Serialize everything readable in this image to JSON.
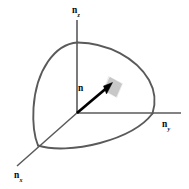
{
  "figure": {
    "type": "geometry-diagram",
    "canvas": {
      "width": 189,
      "height": 189,
      "background": "#ffffff"
    },
    "colors": {
      "arc_stroke": "#5a5a5a",
      "axis_stroke": "#5a5a5a",
      "vector_stroke": "#000000",
      "patch_fill": "#c9c9c9",
      "patch_stroke": "#b4b4b4",
      "text": "#0a0a0a",
      "background": "#ffffff"
    },
    "origin": {
      "x": 77,
      "y": 113
    },
    "axes": [
      {
        "name": "n-z-axis",
        "label_main": "n",
        "label_sub": "z",
        "direction": "up",
        "from": {
          "x": 77,
          "y": 113
        },
        "to": {
          "x": 77,
          "y": 20
        },
        "sphere_intersection": {
          "x": 77,
          "y": 42
        }
      },
      {
        "name": "n-y-axis",
        "label_main": "n",
        "label_sub": "y",
        "direction": "right",
        "from": {
          "x": 77,
          "y": 113
        },
        "to": {
          "x": 181,
          "y": 113
        },
        "sphere_intersection": {
          "x": 152,
          "y": 113
        }
      },
      {
        "name": "n-x-axis",
        "label_main": "n",
        "label_sub": "x",
        "direction": "down-left",
        "from": {
          "x": 77,
          "y": 113
        },
        "to": {
          "x": 17,
          "y": 166
        },
        "sphere_intersection": {
          "x": 38,
          "y": 145
        }
      }
    ],
    "vector": {
      "name": "normal-vector-n",
      "label": "n",
      "label_position": {
        "x": 78,
        "y": 84
      },
      "tail": {
        "x": 77,
        "y": 113
      },
      "tip": {
        "x": 111,
        "y": 84
      },
      "stroke_width": 2.6,
      "arrowhead": true
    },
    "surface_patch": {
      "name": "surface-element-patch",
      "description": "small shaded quadrilateral surface element at the arrow tip",
      "points": "110,78 121,84 116,96 104,90",
      "fill": "#c9c9c9"
    },
    "arcs": [
      {
        "name": "arc-zx-plane",
        "description": "great-circle arc in the n_z-n_x plane, bulging left",
        "from": {
          "x": 77,
          "y": 42
        },
        "to": {
          "x": 38,
          "y": 145
        },
        "bulge": "left"
      },
      {
        "name": "arc-zy-plane",
        "description": "great-circle arc in the n_z-n_y plane, bulging right",
        "from": {
          "x": 77,
          "y": 42
        },
        "to": {
          "x": 152,
          "y": 113
        },
        "bulge": "right"
      },
      {
        "name": "arc-xy-plane",
        "description": "great-circle arc in the n_x-n_y plane, bulging down",
        "from": {
          "x": 38,
          "y": 145
        },
        "to": {
          "x": 152,
          "y": 113
        },
        "bulge": "down"
      }
    ]
  }
}
